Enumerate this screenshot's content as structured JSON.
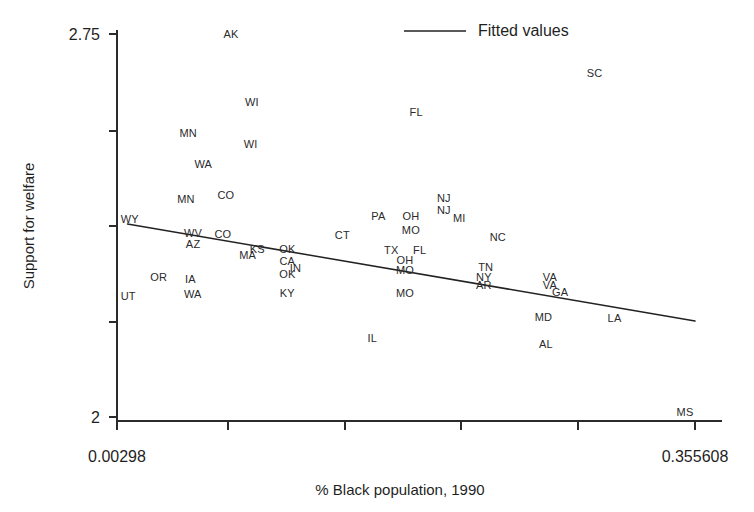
{
  "chart_data": {
    "type": "scatter",
    "title": "",
    "xlabel": "% Black population, 1990",
    "ylabel": "Support for welfare",
    "xlim": [
      0.00298,
      0.355608
    ],
    "ylim": [
      2,
      2.75
    ],
    "xticklabels": [
      "0.00298",
      "0.355608"
    ],
    "yticklabels": [
      "2.75",
      "2"
    ],
    "grid": false,
    "legend": {
      "position": "top-right",
      "entries": [
        "Fitted values"
      ]
    },
    "marker_style": "state-abbreviation-text",
    "points": [
      {
        "label": "AK",
        "x": 0.0725,
        "y": 2.748
      },
      {
        "label": "WI",
        "x": 0.0852,
        "y": 2.615
      },
      {
        "label": "FL",
        "x": 0.1855,
        "y": 2.596
      },
      {
        "label": "SC",
        "x": 0.2943,
        "y": 2.671
      },
      {
        "label": "MN",
        "x": 0.0464,
        "y": 2.554
      },
      {
        "label": "WI",
        "x": 0.0845,
        "y": 2.533
      },
      {
        "label": "WA",
        "x": 0.0556,
        "y": 2.494
      },
      {
        "label": "MN",
        "x": 0.0451,
        "y": 2.424
      },
      {
        "label": "CO",
        "x": 0.0694,
        "y": 2.432
      },
      {
        "label": "NJ",
        "x": 0.2024,
        "y": 2.427
      },
      {
        "label": "NJ",
        "x": 0.2024,
        "y": 2.403
      },
      {
        "label": "MI",
        "x": 0.2118,
        "y": 2.387
      },
      {
        "label": "WY",
        "x": 0.0108,
        "y": 2.386
      },
      {
        "label": "PA",
        "x": 0.1624,
        "y": 2.391
      },
      {
        "label": "OH",
        "x": 0.1823,
        "y": 2.391
      },
      {
        "label": "MO",
        "x": 0.1823,
        "y": 2.365
      },
      {
        "label": "WV",
        "x": 0.0494,
        "y": 2.359
      },
      {
        "label": "CO",
        "x": 0.0676,
        "y": 2.357
      },
      {
        "label": "CT",
        "x": 0.1405,
        "y": 2.354
      },
      {
        "label": "NC",
        "x": 0.2353,
        "y": 2.351
      },
      {
        "label": "AZ",
        "x": 0.0494,
        "y": 2.337
      },
      {
        "label": "KS",
        "x": 0.0886,
        "y": 2.327
      },
      {
        "label": "OK",
        "x": 0.1069,
        "y": 2.326
      },
      {
        "label": "TX",
        "x": 0.1703,
        "y": 2.324
      },
      {
        "label": "FL",
        "x": 0.1876,
        "y": 2.324
      },
      {
        "label": "MA",
        "x": 0.0827,
        "y": 2.316
      },
      {
        "label": "CA",
        "x": 0.1069,
        "y": 2.304
      },
      {
        "label": "OH",
        "x": 0.1787,
        "y": 2.306
      },
      {
        "label": "IN",
        "x": 0.1118,
        "y": 2.289
      },
      {
        "label": "MO",
        "x": 0.1787,
        "y": 2.285
      },
      {
        "label": "TN",
        "x": 0.2279,
        "y": 2.292
      },
      {
        "label": "OK",
        "x": 0.1069,
        "y": 2.277
      },
      {
        "label": "NY",
        "x": 0.2268,
        "y": 2.273
      },
      {
        "label": "VA",
        "x": 0.2671,
        "y": 2.273
      },
      {
        "label": "OR",
        "x": 0.0284,
        "y": 2.272
      },
      {
        "label": "IA",
        "x": 0.0477,
        "y": 2.269
      },
      {
        "label": "AR",
        "x": 0.2268,
        "y": 2.257
      },
      {
        "label": "VA",
        "x": 0.2671,
        "y": 2.257
      },
      {
        "label": "GA",
        "x": 0.2733,
        "y": 2.243
      },
      {
        "label": "KY",
        "x": 0.1069,
        "y": 2.241
      },
      {
        "label": "MO",
        "x": 0.1787,
        "y": 2.241
      },
      {
        "label": "WA",
        "x": 0.0492,
        "y": 2.239
      },
      {
        "label": "UT",
        "x": 0.0098,
        "y": 2.235
      },
      {
        "label": "MD",
        "x": 0.2632,
        "y": 2.194
      },
      {
        "label": "LA",
        "x": 0.3065,
        "y": 2.192
      },
      {
        "label": "IL",
        "x": 0.1588,
        "y": 2.153
      },
      {
        "label": "AL",
        "x": 0.2647,
        "y": 2.141
      },
      {
        "label": "MS",
        "x": 0.3495,
        "y": 2.008
      }
    ],
    "fitted_line": {
      "name": "Fitted values",
      "x_start": 0.00938,
      "y_start": 2.378,
      "x_end": 0.355608,
      "y_end": 2.188
    }
  },
  "axes": {
    "y_title": "Support for welfare",
    "x_title": "% Black population, 1990",
    "y_top_label": "2.75",
    "y_bottom_label": "2",
    "x_left_label": "0.00298",
    "x_right_label": "0.355608"
  },
  "legend": {
    "fitted_label": "Fitted values"
  },
  "colors": {
    "axis": "#2b2b2b",
    "line": "#222222",
    "marker_text": "#2a2a2a",
    "background": "#ffffff"
  }
}
